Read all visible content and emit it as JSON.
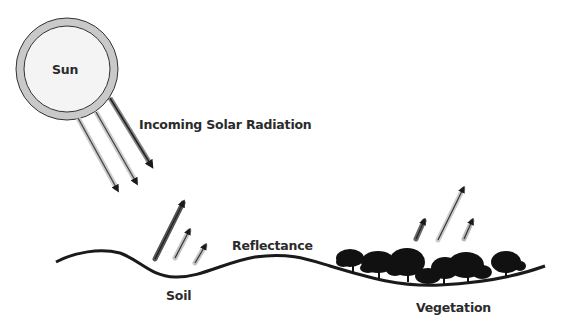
{
  "diagram": {
    "sun": {
      "label": "Sun",
      "ring_color": "#c9c9c9",
      "fill_color": "#f4f4f4"
    },
    "labels": {
      "incoming": "Incoming Solar Radiation",
      "reflectance": "Reflectance",
      "soil": "Soil",
      "vegetation": "Vegetation"
    },
    "colors": {
      "line": "#1a1a1a",
      "arrow_dark": "#555555",
      "arrow_mid": "#9a9a9a",
      "arrow_light": "#c8c8c8",
      "tree": "#111111"
    }
  }
}
